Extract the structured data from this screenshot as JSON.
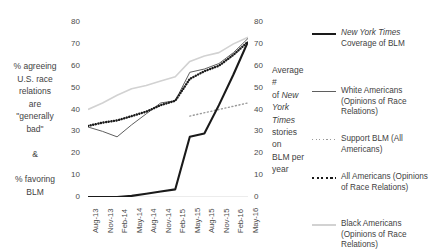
{
  "chart_data": {
    "type": "line",
    "title": "",
    "categories": [
      "Aug-13",
      "Nov-13",
      "Feb-14",
      "May-14",
      "Aug-14",
      "Nov-14",
      "Feb-15",
      "May-15",
      "Aug-15",
      "Nov-15",
      "Feb-16",
      "May-16"
    ],
    "xlabel": "",
    "left_axis": {
      "label": "% agreeing U.S. race relations are \"generally bad\" & % favoring BLM",
      "ticks": [
        0,
        10,
        20,
        30,
        40,
        50,
        60,
        70,
        80
      ],
      "ylim": [
        0,
        80
      ]
    },
    "right_axis": {
      "label_plain_1": "Average # of ",
      "label_italic": "New York Times",
      "label_plain_2": " stories on BLM per year",
      "ticks": [
        0,
        10,
        20,
        30,
        40,
        50,
        60,
        70,
        80
      ],
      "ylim": [
        0,
        80
      ]
    },
    "grid": false,
    "legend_position": "right",
    "series": [
      {
        "name": "nyt-coverage",
        "legend_plain_prefix": "",
        "legend_italic": "New York Times",
        "legend_plain_suffix": " Coverage of BLM",
        "legend_text": "New York Times Coverage of BLM",
        "axis": "right",
        "style": "solid",
        "color": "#1a1a1a",
        "width": 2.1,
        "values": [
          0,
          0,
          0,
          0.5,
          1.5,
          2.5,
          3.5,
          27.5,
          29,
          42,
          56,
          71
        ]
      },
      {
        "name": "white-americans",
        "legend_text": "White Americans (Opinions of Race Relations)",
        "axis": "left",
        "style": "solid",
        "color": "#5f5f5f",
        "width": 1.0,
        "values": [
          32,
          30,
          27.5,
          33,
          38,
          43,
          44,
          57,
          58.5,
          61,
          66,
          72.5
        ]
      },
      {
        "name": "support-blm-all-americans",
        "legend_text": "Support BLM (All Americans)",
        "axis": "left",
        "style": "dotted-fine",
        "color": "#9a9a9a",
        "width": 1.4,
        "values": [
          null,
          null,
          null,
          null,
          null,
          null,
          null,
          37,
          null,
          null,
          null,
          43
        ]
      },
      {
        "name": "all-americans",
        "legend_text": "All Americans (Opinions of Race Relations)",
        "axis": "left",
        "style": "dotted-bold",
        "color": "#1a1a1a",
        "width": 2.4,
        "values": [
          32.5,
          34,
          35,
          37,
          39,
          42,
          44,
          54,
          57.5,
          60,
          65,
          71
        ]
      },
      {
        "name": "black-americans",
        "legend_text": "Black Americans (Opinions of Race Relations)",
        "axis": "left",
        "style": "solid",
        "color": "#d2d2d2",
        "width": 1.6,
        "values": [
          40,
          43,
          46.5,
          49.5,
          51,
          53,
          55,
          62,
          64.5,
          66,
          70,
          73
        ]
      }
    ]
  },
  "legend": {
    "items": [
      {
        "name": "nyt-coverage",
        "italic": "New York Times",
        "rest": "Coverage of BLM"
      },
      {
        "name": "white-americans",
        "italic": "",
        "rest": "White Americans (Opinions of Race Relations)"
      },
      {
        "name": "support-blm-all-americans",
        "italic": "",
        "rest": "Support BLM (All Americans)"
      },
      {
        "name": "all-americans",
        "italic": "",
        "rest": "All Americans (Opinions of Race Relations)"
      },
      {
        "name": "black-americans",
        "italic": "",
        "rest": "Black Americans (Opinions of Race Relations)"
      }
    ]
  },
  "axis_titles": {
    "left": "% agreeing\nU.S. race\nrelations\nare\n\"generally\nbad\"\n\n&\n\n% favoring\nBLM",
    "right_part1": "Average #",
    "right_part2": "of ",
    "right_italic1": "New",
    "right_italic2": "York",
    "right_italic3": "Times",
    "right_part3": "stories on",
    "right_part4": "BLM per",
    "right_part5": "year"
  }
}
